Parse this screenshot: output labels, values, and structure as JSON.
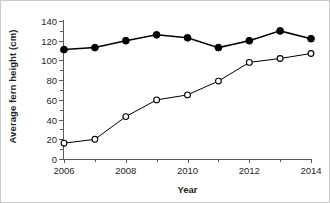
{
  "chart_data": {
    "type": "line",
    "title": "",
    "xlabel": "Year",
    "ylabel": "Average fern height (cm)",
    "x": [
      2006,
      2007,
      2008,
      2009,
      2010,
      2011,
      2012,
      2013,
      2014
    ],
    "xlim": [
      2006,
      2014
    ],
    "ylim": [
      0,
      140
    ],
    "xticks": [
      2006,
      2007,
      2008,
      2009,
      2010,
      2011,
      2012,
      2013,
      2014
    ],
    "xticklabels": [
      "2006",
      "",
      "2008",
      "",
      "2010",
      "",
      "2012",
      "",
      "2014"
    ],
    "yticks": [
      0,
      20,
      40,
      60,
      80,
      100,
      120,
      140
    ],
    "yticklabels": [
      "0",
      "20",
      "40",
      "60",
      "80",
      "100",
      "120",
      "140"
    ],
    "grid": false,
    "legend": "none",
    "series": [
      {
        "name": "closed-circles",
        "marker": "filled-circle",
        "color": "#000000",
        "values": [
          111,
          113,
          120,
          126,
          123,
          113,
          120,
          130,
          122
        ]
      },
      {
        "name": "open-circles",
        "marker": "open-circle",
        "color": "#000000",
        "values": [
          16,
          20,
          43,
          60,
          65,
          79,
          98,
          102,
          107
        ]
      }
    ]
  },
  "axis": {
    "tick_color": "#58595b",
    "line_color": "#58595b"
  }
}
